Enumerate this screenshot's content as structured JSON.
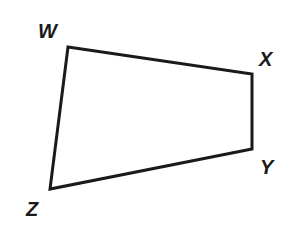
{
  "figure": {
    "shape": "quadrilateral",
    "stroke_color": "#1a1a1a",
    "vertices": [
      {
        "label": "W",
        "x": 68,
        "y": 47
      },
      {
        "label": "X",
        "x": 252,
        "y": 74
      },
      {
        "label": "Y",
        "x": 252,
        "y": 149
      },
      {
        "label": "Z",
        "x": 50,
        "y": 189
      }
    ]
  }
}
